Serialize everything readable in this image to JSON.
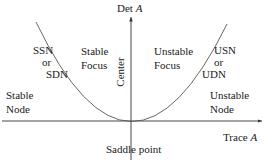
{
  "diagram": {
    "axes": {
      "y_label": "Det",
      "y_label_var": "A",
      "x_label": "Trace",
      "x_label_var": "A"
    },
    "regions": {
      "ssn": {
        "line1": "SSN",
        "line2": "or",
        "line3": "SDN"
      },
      "stable_focus": {
        "line1": "Stable",
        "line2": "Focus"
      },
      "unstable_focus": {
        "line1": "Unstable",
        "line2": "Focus"
      },
      "usn": {
        "line1": "USN",
        "line2": "or",
        "line3": "UDN"
      },
      "stable_node": {
        "line1": "Stable",
        "line2": "Node"
      },
      "unstable_node": {
        "line1": "Unstable",
        "line2": "Node"
      },
      "center": "Center",
      "saddle": "Saddle point"
    },
    "colors": {
      "line": "#333333",
      "curve": "#555555",
      "text": "#1a1a1a"
    }
  }
}
